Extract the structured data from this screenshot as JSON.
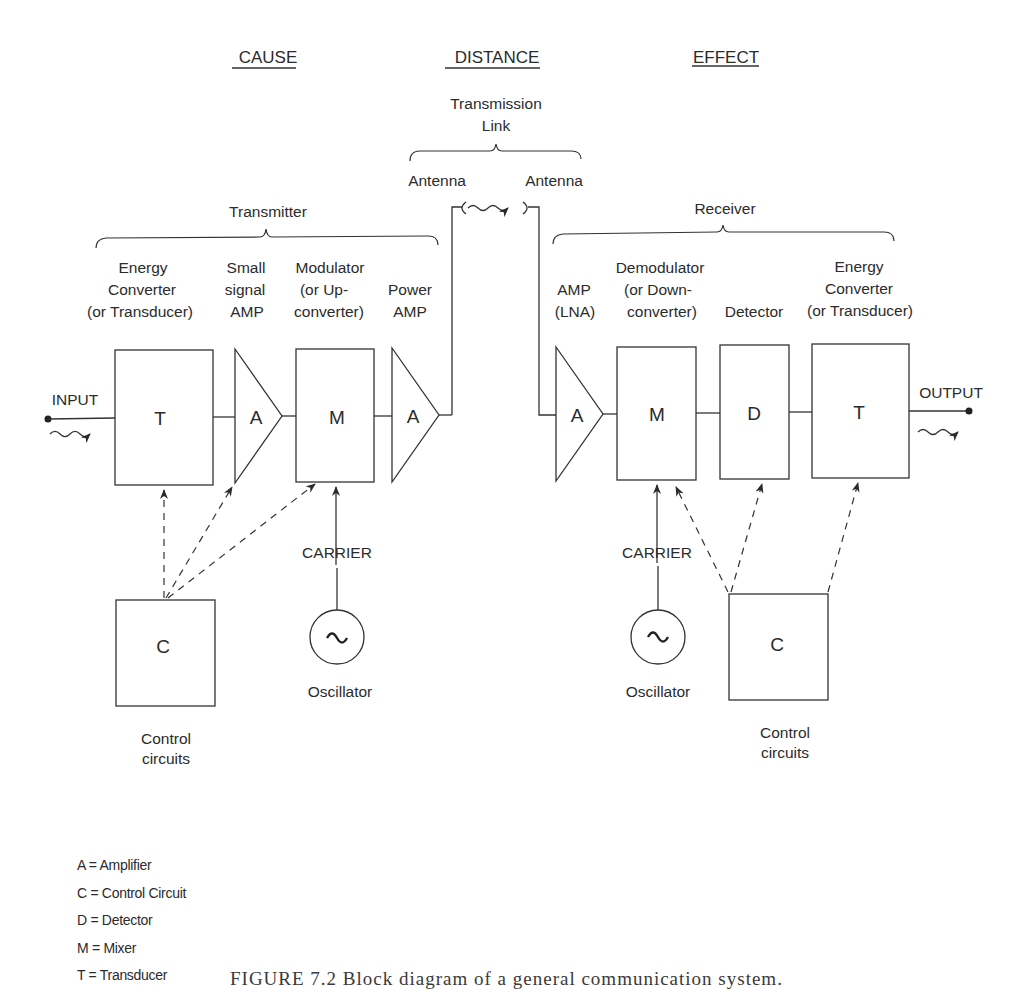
{
  "headers": {
    "cause": "CAUSE",
    "distance": "DISTANCE",
    "effect": "EFFECT"
  },
  "transmission_link": {
    "title_line1": "Transmission",
    "title_line2": "Link",
    "antenna_left": "Antenna",
    "antenna_right": "Antenna"
  },
  "transmitter": {
    "title": "Transmitter",
    "labels": {
      "energy_converter": [
        "Energy",
        "Converter",
        "(or Transducer)"
      ],
      "small_signal_amp": [
        "Small",
        "signal",
        "AMP"
      ],
      "modulator": [
        "Modulator",
        "(or Up-",
        "converter)"
      ],
      "power_amp": [
        "Power",
        "AMP"
      ]
    },
    "blocks": {
      "transducer": "T",
      "small_amp": "A",
      "mixer": "M",
      "power_amp": "A"
    },
    "input_label": "INPUT",
    "carrier_label": "CARRIER",
    "oscillator_label": "Oscillator",
    "oscillator_symbol": "~",
    "control_block": "C",
    "control_label": [
      "Control",
      "circuits"
    ]
  },
  "receiver": {
    "title": "Receiver",
    "labels": {
      "amp": [
        "AMP",
        "(LNA)"
      ],
      "demodulator": [
        "Demodulator",
        "(or Down-",
        "converter)"
      ],
      "detector": [
        "Detector"
      ],
      "energy_converter": [
        "Energy",
        "Converter",
        "(or Transducer)"
      ]
    },
    "blocks": {
      "amp": "A",
      "mixer": "M",
      "detector": "D",
      "transducer": "T"
    },
    "output_label": "OUTPUT",
    "carrier_label": "CARRIER",
    "oscillator_label": "Oscillator",
    "oscillator_symbol": "~",
    "control_block": "C",
    "control_label": [
      "Control",
      "circuits"
    ]
  },
  "legend": [
    "A = Amplifier",
    "C = Control Circuit",
    "D = Detector",
    "M = Mixer",
    "T = Transducer"
  ],
  "caption": "FIGURE 7.2   Block diagram of a general communication system."
}
